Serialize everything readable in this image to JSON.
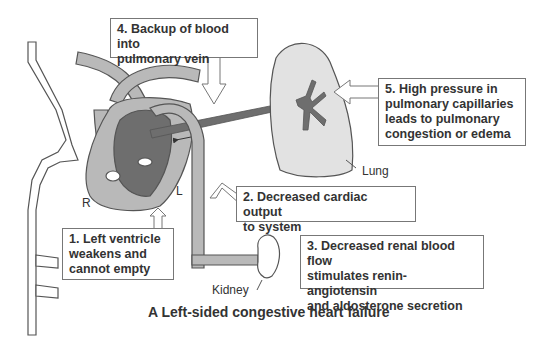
{
  "figure": {
    "caption": "A  Left-sided congestive heart failure",
    "colors": {
      "vessel_fill": "#b9b9b9",
      "heart_dark": "#6e6e6e",
      "lung_fill": "#e2e2e2",
      "outline": "#555555",
      "box_border": "#777777",
      "text": "#333333"
    }
  },
  "labels": {
    "right": "R",
    "left": "L",
    "lung": "Lung",
    "kidney": "Kidney"
  },
  "steps": [
    {
      "number": "1.",
      "text_lines": [
        "1. Left ventricle",
        "weakens and",
        "cannot empty"
      ]
    },
    {
      "number": "2.",
      "text_lines": [
        "2. Decreased cardiac output",
        "to system"
      ]
    },
    {
      "number": "3.",
      "text_lines": [
        "3. Decreased renal blood flow",
        "stimulates renin-angiotensin",
        "and aldosterone secretion"
      ]
    },
    {
      "number": "4.",
      "text_lines": [
        "4. Backup of blood into",
        "pulmonary vein"
      ]
    },
    {
      "number": "5.",
      "text_lines": [
        "5. High pressure in",
        "pulmonary capillaries",
        "leads to pulmonary",
        "congestion or edema"
      ]
    }
  ]
}
